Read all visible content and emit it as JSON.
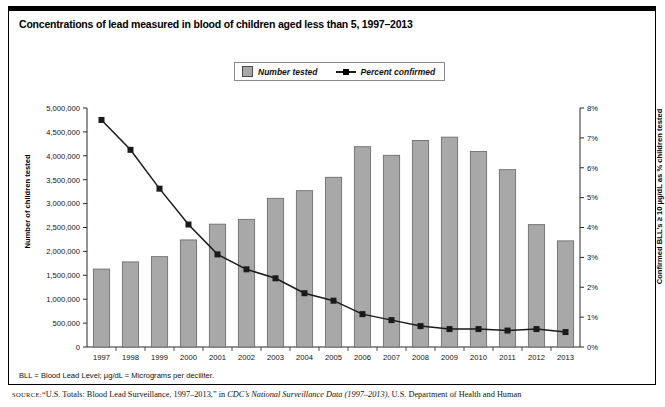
{
  "title": "Concentrations of lead measured in blood of children aged less than 5, 1997–2013",
  "legend": {
    "bar_label": "Number tested",
    "line_label": "Percent confirmed",
    "bar_color": "#a8a8a8",
    "line_color": "#1a1a1a"
  },
  "footnote": "BLL = Blood Lead Level; µg/dL = Micrograms per deciliter.",
  "source": {
    "keyword": "SOURCE:",
    "part1": "“U.S. Totals: Blood Lead Surveillance, 1997–2013,” in ",
    "italic": "CDC’s National Surveillance Data (1997–2013)",
    "part2": ", U.S. Department of Health and Human"
  },
  "chart_data": {
    "type": "bar",
    "title": "Concentrations of lead measured in blood of children aged less than 5, 1997–2013",
    "xlabel": "",
    "ylabel": "Number of children tested",
    "y2label": "Confirmed BLL's ≥ 10 µg/dL as % children tested",
    "categories": [
      "1997",
      "1998",
      "1999",
      "2000",
      "2001",
      "2002",
      "2003",
      "2004",
      "2005",
      "2006",
      "2007",
      "2008",
      "2009",
      "2010",
      "2011",
      "2012",
      "2013"
    ],
    "ylim": [
      0,
      5000000
    ],
    "y2lim": [
      0,
      8
    ],
    "ytick_labels": [
      "0",
      "500,000",
      "1,000,000",
      "1,500,000",
      "2,000,000",
      "2,500,000",
      "3,000,000",
      "3,500,000",
      "4,000,000",
      "4,500,000",
      "5,000,000"
    ],
    "ytick_values": [
      0,
      500000,
      1000000,
      1500000,
      2000000,
      2500000,
      3000000,
      3500000,
      4000000,
      4500000,
      5000000
    ],
    "y2tick_labels": [
      "0%",
      "1%",
      "2%",
      "3%",
      "4%",
      "5%",
      "6%",
      "7%",
      "8%"
    ],
    "y2tick_values": [
      0,
      1,
      2,
      3,
      4,
      5,
      6,
      7,
      8
    ],
    "grid": false,
    "legend_position": "top-center",
    "series": [
      {
        "name": "Number tested",
        "type": "bar",
        "axis": "left",
        "values": [
          1630000,
          1780000,
          1890000,
          2240000,
          2570000,
          2670000,
          3110000,
          3270000,
          3550000,
          4190000,
          4010000,
          4320000,
          4390000,
          4090000,
          3710000,
          2560000,
          2220000
        ]
      },
      {
        "name": "Percent confirmed",
        "type": "line",
        "axis": "right",
        "values": [
          7.6,
          6.6,
          5.3,
          4.1,
          3.1,
          2.6,
          2.3,
          1.8,
          1.55,
          1.1,
          0.9,
          0.7,
          0.6,
          0.6,
          0.55,
          0.6,
          0.5
        ]
      }
    ]
  }
}
